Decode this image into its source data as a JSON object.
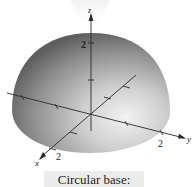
{
  "figure": {
    "surface": "hemisphere",
    "axes": {
      "x": {
        "label": "x",
        "tick_label": "2"
      },
      "y": {
        "label": "y",
        "tick_label": "2"
      },
      "z": {
        "label": "z",
        "tick_label": "2"
      }
    },
    "colors": {
      "surface_dark": "#6e6e6e",
      "surface_mid": "#a9a9a9",
      "surface_light": "#ececec",
      "axis": "#2a2a2a",
      "background": "#ffffff"
    }
  },
  "caption": {
    "text": "Circular base:"
  }
}
